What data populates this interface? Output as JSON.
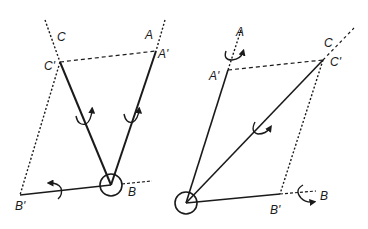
{
  "figure": {
    "ink_color": "#1a1a1a",
    "background": "#ffffff"
  },
  "left_diagram": {
    "labels": {
      "C": "C",
      "C_prime": "C'",
      "A": "A",
      "A_prime": "A'",
      "B": "B",
      "B_prime": "B'"
    },
    "rotation_arrows": 3,
    "pivot": "circle-at-B"
  },
  "right_diagram": {
    "labels": {
      "A": "A",
      "A_prime": "A'",
      "C": "C",
      "C_prime": "C'",
      "B": "B",
      "B_prime": "B'"
    },
    "rotation_arrows": 3,
    "pivot": "circle-at-origin"
  }
}
